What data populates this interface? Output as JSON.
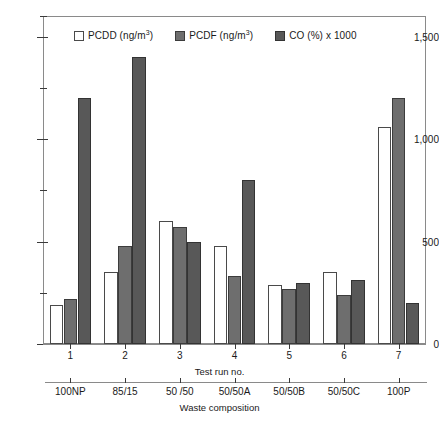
{
  "chart_data": {
    "type": "bar",
    "title": "",
    "xlabel": "Test run no.",
    "ylabel": "",
    "ylim": [
      0,
      1600
    ],
    "yticks_major": [
      0,
      500,
      1000,
      1500
    ],
    "ytick_labels": [
      "0",
      "500",
      "1,000",
      "1,500"
    ],
    "yticks_minor": [
      250,
      750,
      1250,
      1600
    ],
    "grid": false,
    "legend_position": "top-inside",
    "categories": [
      "1",
      "2",
      "3",
      "4",
      "5",
      "6",
      "7"
    ],
    "secondary_xlabel": "Waste composition",
    "secondary_categories": [
      "100NP",
      "85/15",
      "50 /50",
      "50/50A",
      "50/50B",
      "50/50C",
      "100P"
    ],
    "series": [
      {
        "name": "PCDD (ng/m3)",
        "legend_label": "PCDD (ng/m",
        "legend_unit_sup": "3",
        "legend_suffix": ")",
        "color": "#ffffff",
        "border": "#4a4a4a",
        "values": [
          190,
          350,
          600,
          480,
          290,
          350,
          1060
        ]
      },
      {
        "name": "PCDF (ng/m3)",
        "legend_label": "PCDF (ng/m",
        "legend_unit_sup": "3",
        "legend_suffix": ")",
        "color": "#6e6e6e",
        "border": "#3c3c3c",
        "values": [
          220,
          480,
          570,
          330,
          270,
          240,
          1200
        ]
      },
      {
        "name": "CO (%) x 1000",
        "legend_label": "CO (%) x 1000",
        "legend_unit_sup": "",
        "legend_suffix": "",
        "color": "#585858",
        "border": "#333333",
        "values": [
          1200,
          1400,
          500,
          800,
          300,
          310,
          200
        ]
      }
    ]
  }
}
